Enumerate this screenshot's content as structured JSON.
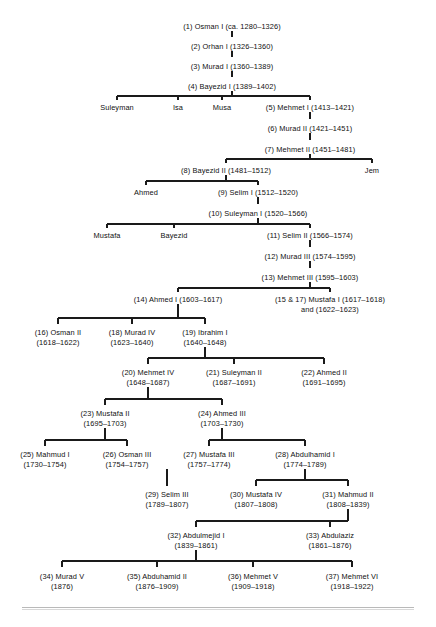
{
  "diagram": {
    "type": "family-tree",
    "line_color": "#1a1a1a",
    "text_color": "#101010",
    "background": "#ffffff",
    "nodes": [
      {
        "id": "n1",
        "line1": "(1) Osman I (ca. 1280–1326)",
        "line2": "",
        "x": 232,
        "y": 22
      },
      {
        "id": "n2",
        "line1": "(2) Orhan I (1326–1360)",
        "line2": "",
        "x": 232,
        "y": 42
      },
      {
        "id": "n3",
        "line1": "(3) Murad I (1360–1389)",
        "line2": "",
        "x": 232,
        "y": 62
      },
      {
        "id": "n4",
        "line1": "(4) Bayezid I (1389–1402)",
        "line2": "",
        "x": 232,
        "y": 82
      },
      {
        "id": "n_suleyman",
        "line1": "Suleyman",
        "line2": "",
        "x": 117,
        "y": 103
      },
      {
        "id": "n_isa",
        "line1": "Isa",
        "line2": "",
        "x": 178,
        "y": 103
      },
      {
        "id": "n_musa",
        "line1": "Musa",
        "line2": "",
        "x": 222,
        "y": 103
      },
      {
        "id": "n5",
        "line1": "(5) Mehmet I (1413–1421)",
        "line2": "",
        "x": 310,
        "y": 103
      },
      {
        "id": "n6",
        "line1": "(6) Murad II (1421–1451)",
        "line2": "",
        "x": 310,
        "y": 124
      },
      {
        "id": "n7",
        "line1": "(7) Mehmet II (1451–1481)",
        "line2": "",
        "x": 310,
        "y": 145
      },
      {
        "id": "n8",
        "line1": "(8) Bayezid II (1481–1512)",
        "line2": "",
        "x": 226,
        "y": 166
      },
      {
        "id": "n_jem",
        "line1": "Jem",
        "line2": "",
        "x": 372,
        "y": 166
      },
      {
        "id": "n_ahmed",
        "line1": "Ahmed",
        "line2": "",
        "x": 146,
        "y": 188
      },
      {
        "id": "n9",
        "line1": "(9) Selim I (1512–1520)",
        "line2": "",
        "x": 258,
        "y": 188
      },
      {
        "id": "n10",
        "line1": "(10) Suleyman I (1520–1566)",
        "line2": "",
        "x": 258,
        "y": 209
      },
      {
        "id": "n_mustafa",
        "line1": "Mustafa",
        "line2": "",
        "x": 107,
        "y": 231
      },
      {
        "id": "n_bayezid",
        "line1": "Bayezid",
        "line2": "",
        "x": 174,
        "y": 231
      },
      {
        "id": "n11",
        "line1": "(11) Selim II (1566–1574)",
        "line2": "",
        "x": 310,
        "y": 231
      },
      {
        "id": "n12",
        "line1": "(12) Murad III (1574–1595)",
        "line2": "",
        "x": 310,
        "y": 252
      },
      {
        "id": "n13",
        "line1": "(13) Mehmet III (1595–1603)",
        "line2": "",
        "x": 310,
        "y": 273
      },
      {
        "id": "n14",
        "line1": "(14) Ahmed I (1603–1617)",
        "line2": "",
        "x": 178,
        "y": 295
      },
      {
        "id": "n15",
        "line1": "(15 & 17) Mustafa I (1617–1618)",
        "line2": "and (1622–1623)",
        "x": 330,
        "y": 295
      },
      {
        "id": "n16",
        "line1": "(16) Osman II",
        "line2": "(1618–1622)",
        "x": 58,
        "y": 328
      },
      {
        "id": "n18",
        "line1": "(18) Murad IV",
        "line2": "(1623–1640)",
        "x": 132,
        "y": 328
      },
      {
        "id": "n19",
        "line1": "(19) Ibrahim I",
        "line2": "(1640–1648)",
        "x": 205,
        "y": 328
      },
      {
        "id": "n20",
        "line1": "(20) Mehmet IV",
        "line2": "(1648–1687)",
        "x": 148,
        "y": 368
      },
      {
        "id": "n21",
        "line1": "(21) Suleyman II",
        "line2": "(1687–1691)",
        "x": 234,
        "y": 368
      },
      {
        "id": "n22",
        "line1": "(22) Ahmed II",
        "line2": "(1691–1695)",
        "x": 324,
        "y": 368
      },
      {
        "id": "n23",
        "line1": "(23) Mustafa II",
        "line2": "(1695–1703)",
        "x": 105,
        "y": 409
      },
      {
        "id": "n24",
        "line1": "(24) Ahmed III",
        "line2": "(1703–1730)",
        "x": 222,
        "y": 409
      },
      {
        "id": "n25",
        "line1": "(25) Mahmud I",
        "line2": "(1730–1754)",
        "x": 45,
        "y": 450
      },
      {
        "id": "n26",
        "line1": "(26) Osman III",
        "line2": "(1754–1757)",
        "x": 127,
        "y": 450
      },
      {
        "id": "n27",
        "line1": "(27) Mustafa III",
        "line2": "(1757–1774)",
        "x": 209,
        "y": 450
      },
      {
        "id": "n28",
        "line1": "(28) Abdulhamid I",
        "line2": "(1774–1789)",
        "x": 305,
        "y": 450
      },
      {
        "id": "n29",
        "line1": "(29) Selim III",
        "line2": "(1789–1807)",
        "x": 167,
        "y": 490
      },
      {
        "id": "n30",
        "line1": "(30) Mustafa IV",
        "line2": "(1807–1808)",
        "x": 256,
        "y": 490
      },
      {
        "id": "n31",
        "line1": "(31) Mahmud II",
        "line2": "(1808–1839)",
        "x": 348,
        "y": 490
      },
      {
        "id": "n32",
        "line1": "(32) Abdulmejid I",
        "line2": "(1839–1861)",
        "x": 196,
        "y": 531
      },
      {
        "id": "n33",
        "line1": "(33) Abdulaziz",
        "line2": "(1861–1876)",
        "x": 330,
        "y": 531
      },
      {
        "id": "n34",
        "line1": "(34) Murad V",
        "line2": "(1876)",
        "x": 62,
        "y": 572
      },
      {
        "id": "n35",
        "line1": "(35) Abduhamid II",
        "line2": "(1876–1909)",
        "x": 157,
        "y": 572
      },
      {
        "id": "n36",
        "line1": "(36) Mehmet V",
        "line2": "(1909–1918)",
        "x": 253,
        "y": 572
      },
      {
        "id": "n37",
        "line1": "(37) Mehmet VI",
        "line2": "(1918–1922)",
        "x": 352,
        "y": 572
      }
    ],
    "connectors": {
      "verticals": [
        {
          "id": "v1-2",
          "x": 232,
          "y1": 31,
          "y2": 37
        },
        {
          "id": "v2-3",
          "x": 232,
          "y1": 51,
          "y2": 57
        },
        {
          "id": "v3-4",
          "x": 232,
          "y1": 71,
          "y2": 77
        },
        {
          "id": "v4-bus",
          "x": 232,
          "y1": 91,
          "y2": 96
        },
        {
          "id": "v-suleyman",
          "x": 117,
          "y1": 96,
          "y2": 100
        },
        {
          "id": "v-isa",
          "x": 178,
          "y1": 96,
          "y2": 100
        },
        {
          "id": "v-musa",
          "x": 222,
          "y1": 96,
          "y2": 100
        },
        {
          "id": "v-mehmet1",
          "x": 310,
          "y1": 96,
          "y2": 100
        },
        {
          "id": "v5-6",
          "x": 310,
          "y1": 112,
          "y2": 119
        },
        {
          "id": "v6-7",
          "x": 310,
          "y1": 133,
          "y2": 140
        },
        {
          "id": "v7-bus",
          "x": 310,
          "y1": 154,
          "y2": 159
        },
        {
          "id": "v-bay2",
          "x": 226,
          "y1": 159,
          "y2": 163
        },
        {
          "id": "v-jem",
          "x": 372,
          "y1": 159,
          "y2": 163
        },
        {
          "id": "v8-bus",
          "x": 226,
          "y1": 175,
          "y2": 181
        },
        {
          "id": "v-ahmed",
          "x": 146,
          "y1": 181,
          "y2": 185
        },
        {
          "id": "v-selim1",
          "x": 258,
          "y1": 181,
          "y2": 185
        },
        {
          "id": "v9-10",
          "x": 258,
          "y1": 197,
          "y2": 204
        },
        {
          "id": "v10-bus",
          "x": 258,
          "y1": 218,
          "y2": 224
        },
        {
          "id": "v-mustafa",
          "x": 107,
          "y1": 224,
          "y2": 228
        },
        {
          "id": "v-bayezid",
          "x": 174,
          "y1": 224,
          "y2": 228
        },
        {
          "id": "v-selim2",
          "x": 310,
          "y1": 224,
          "y2": 228
        },
        {
          "id": "v11-12",
          "x": 310,
          "y1": 240,
          "y2": 247
        },
        {
          "id": "v12-13",
          "x": 310,
          "y1": 261,
          "y2": 268
        },
        {
          "id": "v13-bus",
          "x": 310,
          "y1": 282,
          "y2": 288
        },
        {
          "id": "v14",
          "x": 178,
          "y1": 288,
          "y2": 292
        },
        {
          "id": "v15",
          "x": 330,
          "y1": 288,
          "y2": 292
        },
        {
          "id": "v14-bus",
          "x": 178,
          "y1": 304,
          "y2": 318
        },
        {
          "id": "v16",
          "x": 58,
          "y1": 318,
          "y2": 324
        },
        {
          "id": "v18",
          "x": 132,
          "y1": 318,
          "y2": 324
        },
        {
          "id": "v19",
          "x": 205,
          "y1": 318,
          "y2": 324
        },
        {
          "id": "v19-bus",
          "x": 205,
          "y1": 347,
          "y2": 358
        },
        {
          "id": "v20",
          "x": 148,
          "y1": 358,
          "y2": 364
        },
        {
          "id": "v21",
          "x": 234,
          "y1": 358,
          "y2": 364
        },
        {
          "id": "v22",
          "x": 324,
          "y1": 358,
          "y2": 364
        },
        {
          "id": "v20-bus",
          "x": 148,
          "y1": 387,
          "y2": 399
        },
        {
          "id": "v23",
          "x": 105,
          "y1": 399,
          "y2": 405
        },
        {
          "id": "v24",
          "x": 222,
          "y1": 399,
          "y2": 405
        },
        {
          "id": "v23-bus",
          "x": 105,
          "y1": 428,
          "y2": 440
        },
        {
          "id": "v25",
          "x": 45,
          "y1": 440,
          "y2": 446
        },
        {
          "id": "v26",
          "x": 127,
          "y1": 440,
          "y2": 446
        },
        {
          "id": "v24-bus",
          "x": 222,
          "y1": 428,
          "y2": 440
        },
        {
          "id": "v27",
          "x": 209,
          "y1": 440,
          "y2": 446
        },
        {
          "id": "v28",
          "x": 305,
          "y1": 440,
          "y2": 446
        },
        {
          "id": "v27-29",
          "x": 167,
          "y1": 469,
          "y2": 486
        },
        {
          "id": "v28-bus",
          "x": 305,
          "y1": 469,
          "y2": 480
        },
        {
          "id": "v30",
          "x": 256,
          "y1": 480,
          "y2": 486
        },
        {
          "id": "v31",
          "x": 348,
          "y1": 480,
          "y2": 486
        },
        {
          "id": "v31-bus",
          "x": 348,
          "y1": 509,
          "y2": 521
        },
        {
          "id": "v32",
          "x": 196,
          "y1": 521,
          "y2": 527
        },
        {
          "id": "v33",
          "x": 330,
          "y1": 521,
          "y2": 527
        },
        {
          "id": "v32-bus",
          "x": 196,
          "y1": 550,
          "y2": 561
        },
        {
          "id": "v34",
          "x": 62,
          "y1": 561,
          "y2": 567
        },
        {
          "id": "v35",
          "x": 157,
          "y1": 561,
          "y2": 567
        },
        {
          "id": "v36",
          "x": 253,
          "y1": 561,
          "y2": 567
        },
        {
          "id": "v37",
          "x": 352,
          "y1": 561,
          "y2": 567
        }
      ],
      "horizontals": [
        {
          "id": "h-bayezid1-children",
          "y": 96,
          "x1": 117,
          "x2": 310
        },
        {
          "id": "h-mehmet2-children",
          "y": 159,
          "x1": 226,
          "x2": 372
        },
        {
          "id": "h-bayezid2-children",
          "y": 181,
          "x1": 146,
          "x2": 258
        },
        {
          "id": "h-suleyman1-children",
          "y": 224,
          "x1": 107,
          "x2": 310
        },
        {
          "id": "h-mehmet3-children",
          "y": 288,
          "x1": 178,
          "x2": 330
        },
        {
          "id": "h-ahmed1-children",
          "y": 318,
          "x1": 58,
          "x2": 205
        },
        {
          "id": "h-ibrahim1-children",
          "y": 358,
          "x1": 148,
          "x2": 324
        },
        {
          "id": "h-mehmet4-children",
          "y": 399,
          "x1": 105,
          "x2": 222
        },
        {
          "id": "h-mustafa2-children",
          "y": 440,
          "x1": 45,
          "x2": 127
        },
        {
          "id": "h-ahmed3-children",
          "y": 440,
          "x1": 209,
          "x2": 305
        },
        {
          "id": "h-abdulhamid1-kids",
          "y": 480,
          "x1": 256,
          "x2": 348
        },
        {
          "id": "h-mahmud2-children",
          "y": 521,
          "x1": 196,
          "x2": 348
        },
        {
          "id": "h-abdulmejid1-kids",
          "y": 561,
          "x1": 62,
          "x2": 352
        }
      ]
    }
  }
}
